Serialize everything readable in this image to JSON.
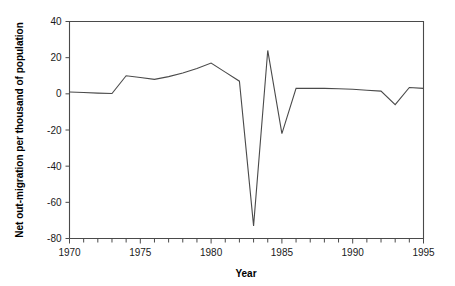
{
  "chart_data": {
    "type": "line",
    "title": "",
    "xlabel": "Year",
    "ylabel": "Net out-migration per thousand of population",
    "xlim": [
      1970,
      1995
    ],
    "ylim": [
      -80,
      40
    ],
    "grid": false,
    "legend": "none",
    "x_ticks_major": [
      1970,
      1975,
      1980,
      1985,
      1990,
      1995
    ],
    "x_tick_labels": [
      "1970",
      "1975",
      "1980",
      "1985",
      "1990",
      "1995"
    ],
    "x_minor_step": 1,
    "y_ticks": [
      40,
      20,
      0,
      -20,
      -40,
      -60,
      -80
    ],
    "y_tick_labels": [
      "40",
      "20",
      "0",
      "-20",
      "-40",
      "-60",
      "-80"
    ],
    "series": [
      {
        "name": "Net out-migration",
        "color": "#4a4a4a",
        "x": [
          1970,
          1971,
          1972,
          1973,
          1974,
          1975,
          1976,
          1977,
          1978,
          1979,
          1980,
          1981,
          1982,
          1983,
          1984,
          1985,
          1986,
          1987,
          1988,
          1989,
          1990,
          1991,
          1992,
          1993,
          1994,
          1995
        ],
        "values": [
          1,
          0.7,
          0.4,
          0.2,
          10,
          9,
          8,
          9.5,
          11.5,
          14,
          17,
          12,
          7,
          -73,
          24,
          -22,
          3,
          3,
          3,
          2.8,
          2.5,
          2,
          1.5,
          -6,
          3.5,
          3
        ]
      }
    ]
  },
  "labels": {
    "x_axis_title": "Year",
    "y_axis_title": "Net out-migration per thousand of population"
  }
}
